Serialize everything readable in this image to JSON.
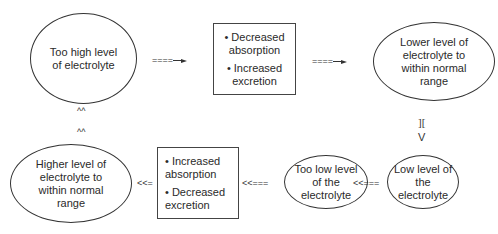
{
  "nodes": {
    "too_high": "Too high level of electrolyte",
    "decrease_box": [
      "• Decreased absorption",
      "• Increased excretion"
    ],
    "lower_level": "Lower level of electrolyte to within normal range",
    "low_level": "Low level of the electrolyte",
    "too_low": "Too low level of the electrolyte",
    "increase_box": [
      "• Increased absorption",
      "• Decreased excretion"
    ],
    "higher_level": "Higher level of electrolyte to within normal range"
  },
  "connectors": {
    "arrow1": "====",
    "arrow2": "====",
    "down_top": "][",
    "down_bottom": "V",
    "left1": "<<===",
    "left2": "<<===",
    "left3": "<<=",
    "up1": "^^",
    "up2": "^^"
  }
}
